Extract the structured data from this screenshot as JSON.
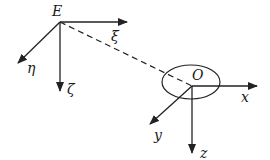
{
  "diagram": {
    "type": "coordinate-frames",
    "colors": {
      "stroke": "#222222",
      "label": "#1a1a1a",
      "background": "#ffffff"
    },
    "frames": [
      {
        "origin_label": "E",
        "origin": [
          60,
          22
        ],
        "axes": [
          {
            "label": "ξ",
            "direction": "right",
            "end": [
              127,
              22
            ]
          },
          {
            "label": "ζ",
            "direction": "down",
            "end": [
              60,
              91
            ]
          },
          {
            "label": "η",
            "direction": "down-left",
            "end": [
              18,
              63
            ]
          }
        ]
      },
      {
        "origin_label": "O",
        "origin": [
          192,
          86
        ],
        "ellipse": {
          "cx": 191,
          "cy": 82,
          "rx": 29,
          "ry": 17
        },
        "axes": [
          {
            "label": "x",
            "direction": "right",
            "end": [
              257,
              86
            ]
          },
          {
            "label": "z",
            "direction": "down",
            "end": [
              192,
              153
            ]
          },
          {
            "label": "y",
            "direction": "down-left",
            "end": [
              150,
              124
            ]
          }
        ]
      }
    ],
    "connector": {
      "from": "E",
      "to": "O",
      "style": "dashed"
    }
  }
}
